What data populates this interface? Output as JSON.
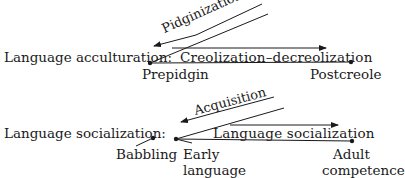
{
  "diagram": {
    "rows": [
      {
        "label": "Language acculturation:",
        "start_point": "Prepidgin",
        "end_point": "Postcreole",
        "forward_process": "Creolization–decreolization",
        "backward_process": "Pidginization"
      },
      {
        "label": "Language socialization:",
        "pre_point": "Babbling",
        "start_point_line1": "Early",
        "start_point_line2": "language",
        "end_point_line1": "Adult",
        "end_point_line2": "competence",
        "forward_process": "Language socialization",
        "backward_process": "Acquisition"
      }
    ],
    "colors": {
      "ink": "#1a1a1a",
      "background": "#ffffff"
    }
  }
}
